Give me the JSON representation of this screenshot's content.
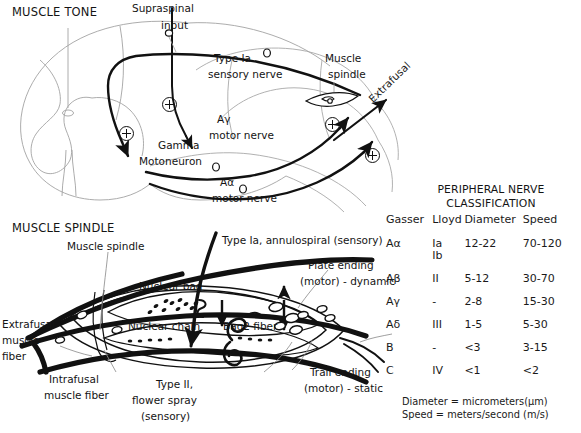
{
  "figure": {
    "panels": {
      "muscle_tone": {
        "title": "MUSCLE TONE",
        "labels": {
          "supraspinal_input_l1": "Supraspinal",
          "supraspinal_input_l2": "input",
          "type_ia_l1": "Type Ia",
          "type_ia_l2": "sensory nerve",
          "muscle_spindle_l1": "Muscle",
          "muscle_spindle_l2": "spindle",
          "gamma_l1": "Gamma",
          "gamma_l2": "Motoneuron",
          "a_gamma_l1": "Aγ",
          "a_gamma_l2": "motor nerve",
          "a_alpha_l1": "Aα",
          "a_alpha_l2": "motor nerve",
          "extrafusal": "Extrafusal"
        },
        "symbols": {
          "excitatory_1": "⊕",
          "excitatory_2": "⊕",
          "excitatory_3": "⊕",
          "excitatory_4": "⊕"
        }
      },
      "muscle_spindle": {
        "title": "MUSCLE SPINDLE",
        "labels": {
          "muscle_spindle": "Muscle spindle",
          "type_ia_l1": "Type Ia, annulospiral (sensory)",
          "plate_ending_l1": "Plate ending",
          "plate_ending_l2": "(motor) - dynamic",
          "nuclear_bag": "Nuclear bag",
          "nuclear_chain": "Nuclear chain",
          "bag2_fiber": "Bag2 fiber",
          "extrafusal_l1": "Extrafusal",
          "extrafusal_l2": "muscle",
          "extrafusal_l3": "fiber",
          "intrafusal_l1": "Intrafusal",
          "intrafusal_l2": "muscle fiber",
          "type_ii_l1": "Type II,",
          "type_ii_l2": "flower spray",
          "type_ii_l3": "(sensory)",
          "trail_ending_l1": "Trail ending",
          "trail_ending_l2": "(motor) - static"
        }
      }
    },
    "table": {
      "title_line1": "PERIPHERAL NERVE",
      "title_line2": "CLASSIFICATION",
      "headers": [
        "Gasser",
        "Lloyd",
        "Diameter",
        "Speed"
      ],
      "rows": [
        {
          "gasser": "Aα",
          "lloyd": "Ia",
          "lloyd2": "Ib",
          "diameter": "12-22",
          "speed": "70-120"
        },
        {
          "gasser": "Aβ",
          "lloyd": "II",
          "lloyd2": "",
          "diameter": "5-12",
          "speed": "30-70"
        },
        {
          "gasser": "Aγ",
          "lloyd": "-",
          "lloyd2": "",
          "diameter": "2-8",
          "speed": "15-30"
        },
        {
          "gasser": "Aδ",
          "lloyd": "III",
          "lloyd2": "",
          "diameter": "1-5",
          "speed": "5-30"
        },
        {
          "gasser": "B",
          "lloyd": "-",
          "lloyd2": "",
          "diameter": "<3",
          "speed": "3-15"
        },
        {
          "gasser": "C",
          "lloyd": "IV",
          "lloyd2": "",
          "diameter": "<1",
          "speed": "<2"
        }
      ],
      "footnote_line1": "Diameter = micrometers(μm)",
      "footnote_line2": "Speed = meters/second (m/s)"
    },
    "colors": {
      "ink": "#141414",
      "faint": "#9a9a9a",
      "background": "#ffffff"
    }
  }
}
